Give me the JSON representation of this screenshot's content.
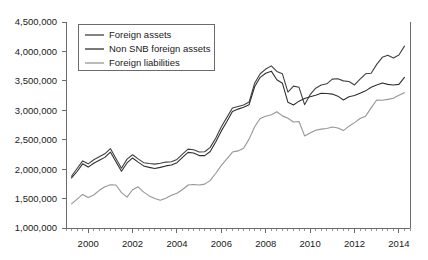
{
  "chart_data": {
    "type": "line",
    "title": "",
    "xlabel": "",
    "ylabel": "",
    "xlim": [
      1999.0,
      2014.5
    ],
    "ylim": [
      1000000,
      4500000
    ],
    "grid": false,
    "legend_position": "top-left",
    "y_ticks": [
      "1,000,000",
      "1,500,000",
      "2,000,000",
      "2,500,000",
      "3,000,000",
      "3,500,000",
      "4,000,000",
      "4,500,000"
    ],
    "y_tick_values": [
      1000000,
      1500000,
      2000000,
      2500000,
      3000000,
      3500000,
      4000000,
      4500000
    ],
    "x_ticks": [
      "2000",
      "2002",
      "2004",
      "2006",
      "2008",
      "2010",
      "2012",
      "2014"
    ],
    "x_tick_values": [
      2000,
      2002,
      2004,
      2006,
      2008,
      2010,
      2012,
      2014
    ],
    "x_minor_step": 0.25,
    "x": [
      1999.25,
      1999.5,
      1999.75,
      2000.0,
      2000.25,
      2000.5,
      2000.75,
      2001.0,
      2001.25,
      2001.5,
      2001.75,
      2002.0,
      2002.25,
      2002.5,
      2002.75,
      2003.0,
      2003.25,
      2003.5,
      2003.75,
      2004.0,
      2004.25,
      2004.5,
      2004.75,
      2005.0,
      2005.25,
      2005.5,
      2005.75,
      2006.0,
      2006.25,
      2006.5,
      2006.75,
      2007.0,
      2007.25,
      2007.5,
      2007.75,
      2008.0,
      2008.25,
      2008.5,
      2008.75,
      2009.0,
      2009.25,
      2009.5,
      2009.75,
      2010.0,
      2010.25,
      2010.5,
      2010.75,
      2011.0,
      2011.25,
      2011.5,
      2011.75,
      2012.0,
      2012.25,
      2012.5,
      2012.75,
      2013.0,
      2013.25,
      2013.5,
      2013.75,
      2014.0,
      2014.25
    ],
    "series": [
      {
        "name": "Foreign assets",
        "color": "#404040",
        "values": [
          1880000,
          2010000,
          2140000,
          2090000,
          2160000,
          2210000,
          2260000,
          2350000,
          2180000,
          2015000,
          2170000,
          2245000,
          2175000,
          2110000,
          2095000,
          2085000,
          2100000,
          2120000,
          2125000,
          2165000,
          2255000,
          2340000,
          2330000,
          2290000,
          2295000,
          2370000,
          2530000,
          2720000,
          2880000,
          3040000,
          3065000,
          3090000,
          3140000,
          3460000,
          3620000,
          3700000,
          3755000,
          3660000,
          3620000,
          3310000,
          3410000,
          3390000,
          3095000,
          3265000,
          3375000,
          3430000,
          3450000,
          3530000,
          3535000,
          3500000,
          3490000,
          3430000,
          3530000,
          3620000,
          3630000,
          3780000,
          3900000,
          3935000,
          3890000,
          3940000,
          4090000
        ]
      },
      {
        "name": "Non SNB foreign assets",
        "color": "#303030",
        "values": [
          1850000,
          1960000,
          2090000,
          2035000,
          2100000,
          2150000,
          2200000,
          2290000,
          2125000,
          1965000,
          2105000,
          2190000,
          2120000,
          2055000,
          2030000,
          2010000,
          2030000,
          2055000,
          2070000,
          2110000,
          2200000,
          2285000,
          2275000,
          2230000,
          2230000,
          2300000,
          2465000,
          2650000,
          2810000,
          2980000,
          3020000,
          3050000,
          3095000,
          3400000,
          3560000,
          3630000,
          3665000,
          3520000,
          3460000,
          3135000,
          3090000,
          3155000,
          3200000,
          3230000,
          3255000,
          3290000,
          3285000,
          3275000,
          3240000,
          3175000,
          3230000,
          3250000,
          3290000,
          3330000,
          3390000,
          3430000,
          3465000,
          3440000,
          3430000,
          3440000,
          3560000
        ]
      },
      {
        "name": "Foreign liabilities",
        "color": "#969696",
        "values": [
          1410000,
          1490000,
          1570000,
          1520000,
          1560000,
          1640000,
          1700000,
          1735000,
          1730000,
          1600000,
          1525000,
          1650000,
          1700000,
          1610000,
          1545000,
          1500000,
          1470000,
          1505000,
          1555000,
          1590000,
          1655000,
          1730000,
          1740000,
          1730000,
          1745000,
          1810000,
          1930000,
          2065000,
          2175000,
          2290000,
          2310000,
          2355000,
          2510000,
          2720000,
          2860000,
          2900000,
          2925000,
          2975000,
          2905000,
          2865000,
          2800000,
          2810000,
          2565000,
          2615000,
          2660000,
          2680000,
          2690000,
          2715000,
          2700000,
          2655000,
          2730000,
          2790000,
          2860000,
          2900000,
          3040000,
          3175000,
          3170000,
          3185000,
          3205000,
          3255000,
          3300000
        ]
      }
    ]
  },
  "legend": {
    "items": [
      {
        "label": "Foreign assets"
      },
      {
        "label": "Non SNB foreign assets"
      },
      {
        "label": "Foreign liabilities"
      }
    ]
  }
}
